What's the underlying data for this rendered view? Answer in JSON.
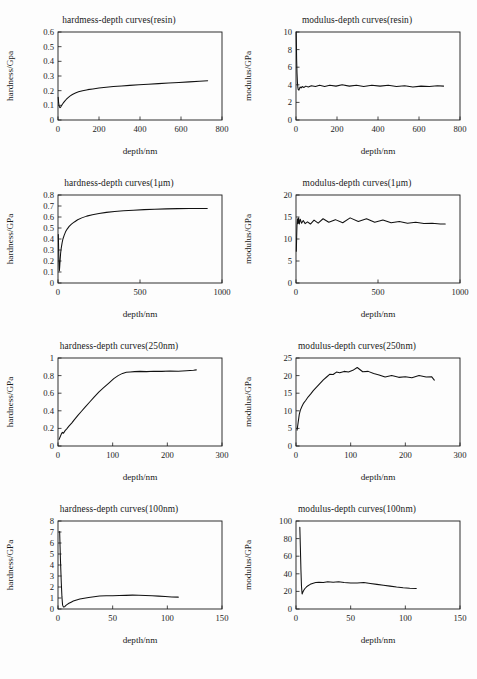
{
  "figure": {
    "caption": "",
    "background": "#ffffff",
    "curve_color": "#111111",
    "axis_color": "#1a1a1a"
  },
  "chart_data": [
    {
      "type": "line",
      "title": "hardmess-depth curves(resin)",
      "xlabel": "depth/nm",
      "ylabel": "hardness/Gpa",
      "xlim": [
        0,
        800
      ],
      "ylim": [
        0,
        0.6
      ],
      "xticks": [
        0,
        200,
        400,
        600,
        800
      ],
      "yticks": [
        "0",
        "0.1",
        "0.2",
        "0.3",
        "0.4",
        "0.5",
        "0.6"
      ],
      "grid": false,
      "legend": "none",
      "x": [
        1,
        3,
        5,
        8,
        10,
        12,
        14,
        16,
        18,
        20,
        24,
        28,
        34,
        40,
        48,
        58,
        70,
        85,
        100,
        120,
        145,
        170,
        200,
        235,
        270,
        310,
        350,
        395,
        440,
        490,
        540,
        590,
        640,
        690,
        730
      ],
      "y": [
        0.155,
        0.118,
        0.098,
        0.087,
        0.084,
        0.086,
        0.09,
        0.095,
        0.1,
        0.104,
        0.112,
        0.12,
        0.13,
        0.14,
        0.151,
        0.163,
        0.174,
        0.184,
        0.192,
        0.2,
        0.207,
        0.212,
        0.218,
        0.223,
        0.228,
        0.232,
        0.236,
        0.24,
        0.244,
        0.248,
        0.252,
        0.256,
        0.26,
        0.264,
        0.267
      ]
    },
    {
      "type": "line",
      "title": "modulus-depth curves(resin)",
      "xlabel": "depth/nm",
      "ylabel": "modulus/GPa",
      "xlim": [
        0,
        800
      ],
      "ylim": [
        0,
        10
      ],
      "xticks": [
        0,
        200,
        400,
        600,
        800
      ],
      "yticks": [
        "0",
        "2",
        "4",
        "6",
        "8",
        "10"
      ],
      "grid": false,
      "legend": "none",
      "x": [
        1,
        2,
        3,
        5,
        7,
        9,
        11,
        14,
        17,
        20,
        25,
        30,
        38,
        48,
        60,
        75,
        95,
        115,
        140,
        165,
        195,
        225,
        260,
        295,
        330,
        370,
        410,
        450,
        490,
        530,
        570,
        610,
        650,
        690,
        720
      ],
      "y": [
        10.0,
        8.6,
        6.9,
        5.3,
        4.3,
        3.7,
        3.45,
        3.4,
        3.55,
        3.75,
        3.65,
        3.8,
        3.7,
        3.85,
        3.75,
        3.9,
        3.8,
        3.95,
        3.8,
        3.95,
        3.85,
        4.0,
        3.85,
        3.95,
        3.8,
        3.95,
        3.85,
        3.95,
        3.8,
        3.9,
        3.75,
        3.85,
        3.8,
        3.9,
        3.85
      ]
    },
    {
      "type": "line",
      "title": "hardness-depth curves(1μm)",
      "xlabel": "depth/nm",
      "ylabel": "hardness/GPa",
      "xlim": [
        0,
        1000
      ],
      "ylim": [
        0,
        0.8
      ],
      "xticks": [
        0,
        500,
        1000
      ],
      "yticks": [
        "0",
        "0.1",
        "0.2",
        "0.3",
        "0.4",
        "0.5",
        "0.6",
        "0.7",
        "0.8"
      ],
      "grid": false,
      "legend": "none",
      "x": [
        2,
        4,
        6,
        8,
        10,
        13,
        16,
        20,
        25,
        30,
        38,
        46,
        56,
        68,
        82,
        100,
        120,
        145,
        175,
        210,
        250,
        295,
        345,
        400,
        460,
        525,
        590,
        660,
        730,
        800,
        860,
        910
      ],
      "y": [
        0.44,
        0.3,
        0.18,
        0.11,
        0.14,
        0.21,
        0.27,
        0.32,
        0.365,
        0.4,
        0.435,
        0.465,
        0.49,
        0.515,
        0.535,
        0.555,
        0.575,
        0.592,
        0.608,
        0.62,
        0.632,
        0.642,
        0.65,
        0.656,
        0.662,
        0.667,
        0.671,
        0.674,
        0.676,
        0.677,
        0.678,
        0.678
      ]
    },
    {
      "type": "line",
      "title": "modulus-depth curves(1μm)",
      "xlabel": "depth/nm",
      "ylabel": "modulus/GPa",
      "xlim": [
        0,
        1000
      ],
      "ylim": [
        0,
        20
      ],
      "xticks": [
        0,
        500,
        1000
      ],
      "yticks": [
        "0",
        "5",
        "10",
        "15",
        "20"
      ],
      "grid": false,
      "legend": "none",
      "x": [
        2,
        4,
        6,
        9,
        12,
        16,
        20,
        26,
        34,
        44,
        56,
        70,
        88,
        110,
        135,
        165,
        200,
        240,
        285,
        330,
        380,
        430,
        480,
        530,
        580,
        630,
        680,
        730,
        780,
        830,
        880,
        910
      ],
      "y": [
        7.2,
        10.5,
        13.2,
        14.6,
        13.5,
        14.8,
        13.4,
        14.5,
        13.6,
        14.2,
        13.5,
        13.9,
        13.4,
        14.3,
        13.6,
        14.6,
        13.8,
        14.4,
        13.7,
        14.8,
        14.0,
        14.6,
        13.8,
        14.3,
        13.7,
        14.0,
        13.6,
        13.8,
        13.5,
        13.6,
        13.4,
        13.4
      ]
    },
    {
      "type": "line",
      "title": "hardness-depth curves(250nm)",
      "xlabel": "depth/nm",
      "ylabel": "hardness/GPa",
      "xlim": [
        0,
        300
      ],
      "ylim": [
        0,
        1
      ],
      "xticks": [
        0,
        100,
        200,
        300
      ],
      "yticks": [
        "0",
        "0.2",
        "0.4",
        "0.6",
        "0.8",
        "1"
      ],
      "grid": false,
      "legend": "none",
      "x": [
        2,
        4,
        6,
        8,
        10,
        13,
        16,
        20,
        25,
        30,
        36,
        43,
        50,
        58,
        66,
        75,
        84,
        93,
        102,
        110,
        118,
        125,
        132,
        140,
        150,
        162,
        175,
        190,
        205,
        220,
        235,
        248,
        253
      ],
      "y": [
        0.075,
        0.105,
        0.135,
        0.155,
        0.145,
        0.175,
        0.195,
        0.225,
        0.26,
        0.3,
        0.345,
        0.395,
        0.445,
        0.5,
        0.555,
        0.615,
        0.665,
        0.715,
        0.765,
        0.8,
        0.825,
        0.838,
        0.842,
        0.845,
        0.848,
        0.845,
        0.85,
        0.848,
        0.852,
        0.85,
        0.855,
        0.86,
        0.865
      ]
    },
    {
      "type": "line",
      "title": "modulus-depth curves(250nm)",
      "xlabel": "depth/nm",
      "ylabel": "modulus/GPa",
      "xlim": [
        0,
        300
      ],
      "ylim": [
        0,
        25
      ],
      "xticks": [
        0,
        100,
        200,
        300
      ],
      "yticks": [
        "0",
        "5",
        "10",
        "15",
        "20",
        "25"
      ],
      "grid": false,
      "legend": "none",
      "x": [
        2,
        4,
        6,
        8,
        11,
        14,
        18,
        22,
        27,
        32,
        38,
        44,
        50,
        56,
        62,
        68,
        74,
        80,
        88,
        96,
        104,
        112,
        122,
        132,
        142,
        152,
        163,
        175,
        188,
        200,
        212,
        225,
        238,
        248,
        253
      ],
      "y": [
        4.5,
        6.8,
        9.0,
        10.2,
        11.3,
        12.2,
        13.0,
        13.9,
        14.8,
        15.8,
        16.8,
        17.8,
        18.8,
        19.6,
        20.4,
        20.3,
        21.0,
        20.8,
        21.2,
        21.0,
        21.5,
        22.3,
        21.1,
        21.2,
        20.6,
        20.2,
        19.6,
        20.0,
        19.5,
        19.7,
        19.4,
        20.0,
        19.6,
        19.7,
        18.7
      ]
    },
    {
      "type": "line",
      "title": "hardness-depth curves(100nm)",
      "xlabel": "depth/nm",
      "ylabel": "hardness/GPa",
      "xlim": [
        0,
        150
      ],
      "ylim": [
        0,
        8
      ],
      "xticks": [
        0,
        50,
        100,
        150
      ],
      "yticks": [
        "0",
        "1",
        "2",
        "3",
        "4",
        "5",
        "6",
        "7",
        "8"
      ],
      "grid": false,
      "legend": "none",
      "x": [
        1.5,
        2.2,
        3.0,
        3.6,
        4.2,
        5.0,
        6.0,
        7.0,
        8.5,
        10,
        12,
        14,
        17,
        20,
        24,
        28,
        33,
        38,
        44,
        50,
        56,
        62,
        68,
        74,
        80,
        86,
        92,
        98,
        104,
        110
      ],
      "y": [
        7.05,
        4.6,
        2.4,
        1.1,
        0.35,
        0.18,
        0.2,
        0.3,
        0.42,
        0.52,
        0.62,
        0.72,
        0.82,
        0.9,
        0.98,
        1.05,
        1.12,
        1.18,
        1.2,
        1.2,
        1.22,
        1.24,
        1.26,
        1.25,
        1.23,
        1.2,
        1.17,
        1.13,
        1.1,
        1.08
      ]
    },
    {
      "type": "line",
      "title": "modulus-depth curves(100nm)",
      "xlabel": "depth/nm",
      "ylabel": "modulus/GPa",
      "xlim": [
        0,
        150
      ],
      "ylim": [
        0,
        100
      ],
      "xticks": [
        0,
        50,
        100,
        150
      ],
      "yticks": [
        "0",
        "20",
        "40",
        "60",
        "80",
        "100"
      ],
      "grid": false,
      "legend": "none",
      "x": [
        3.5,
        4.0,
        4.5,
        5.0,
        5.6,
        6.2,
        7.0,
        8.0,
        9.5,
        11,
        13,
        15,
        18,
        21,
        25,
        29,
        34,
        39,
        44,
        50,
        56,
        62,
        68,
        74,
        80,
        86,
        92,
        98,
        104,
        110
      ],
      "y": [
        93,
        70,
        45,
        26,
        17,
        19,
        21,
        23,
        25,
        26.5,
        28,
        29,
        30,
        30.5,
        30,
        31,
        30.5,
        31,
        30,
        29.5,
        29.5,
        30,
        29,
        28,
        27,
        26,
        25,
        24.2,
        23.6,
        23.2
      ]
    }
  ]
}
